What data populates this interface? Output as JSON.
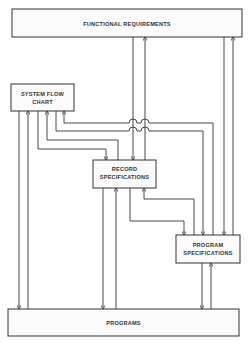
{
  "diagram": {
    "nodes": {
      "functional_requirements": {
        "label": "FUNCTIONAL REQUIREMENTS"
      },
      "system_flow_chart": {
        "line1": "SYSTEM FLOW",
        "line2": "CHART"
      },
      "record_specifications": {
        "line1": "RECORD",
        "line2": "SPECIFICATIONS"
      },
      "program_specifications": {
        "line1": "PROGRAM",
        "line2": "SPECIFICATIONS"
      },
      "programs": {
        "label": "PROGRAMS"
      }
    },
    "edges": [
      {
        "from": "functional_requirements",
        "to": "record_specifications"
      },
      {
        "from": "record_specifications",
        "to": "functional_requirements"
      },
      {
        "from": "functional_requirements",
        "to": "program_specifications"
      },
      {
        "from": "program_specifications",
        "to": "functional_requirements"
      },
      {
        "from": "system_flow_chart",
        "to": "programs"
      },
      {
        "from": "programs",
        "to": "system_flow_chart"
      },
      {
        "from": "system_flow_chart",
        "to": "record_specifications"
      },
      {
        "from": "record_specifications",
        "to": "system_flow_chart"
      },
      {
        "from": "system_flow_chart",
        "to": "program_specifications"
      },
      {
        "from": "program_specifications",
        "to": "system_flow_chart"
      },
      {
        "from": "record_specifications",
        "to": "programs"
      },
      {
        "from": "programs",
        "to": "record_specifications"
      },
      {
        "from": "record_specifications",
        "to": "program_specifications"
      },
      {
        "from": "program_specifications",
        "to": "record_specifications"
      },
      {
        "from": "program_specifications",
        "to": "programs"
      },
      {
        "from": "programs",
        "to": "program_specifications"
      }
    ]
  }
}
